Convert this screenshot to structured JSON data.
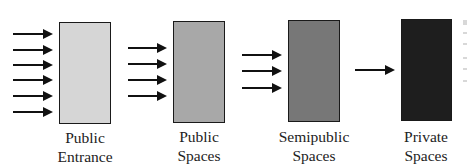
{
  "diagram": {
    "type": "flow-gradient",
    "stages": [
      {
        "id": "public-entrance",
        "label_line1": "Public",
        "label_line2": "Entrance",
        "fill": "#d6d6d6",
        "arrow_count": 6
      },
      {
        "id": "public-spaces",
        "label_line1": "Public",
        "label_line2": "Spaces",
        "fill": "#a8a8a8",
        "arrow_count": 4
      },
      {
        "id": "semipublic-spaces",
        "label_line1": "Semipublic",
        "label_line2": "Spaces",
        "fill": "#777777",
        "arrow_count": 3
      },
      {
        "id": "private-spaces",
        "label_line1": "Private",
        "label_line2": "Spaces",
        "fill": "#1e1e1e",
        "arrow_count": 1
      }
    ]
  }
}
